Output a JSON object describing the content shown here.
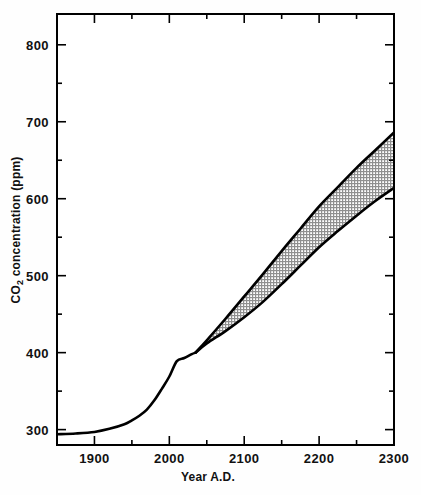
{
  "figure": {
    "background_color": "#fefefe",
    "frame_color": "#000000",
    "curve_color": "#000000",
    "band_fill_color": "#b4b4b4"
  },
  "chart_data": {
    "type": "area",
    "title": "",
    "subtitle": "",
    "xlabel": "Year A.D.",
    "ylabel": "CO2 concentration (ppm)",
    "ylabel_main": "CO",
    "ylabel_sub": "2",
    "ylabel_rest": " concentration (ppm)",
    "xlim": [
      1850,
      2300
    ],
    "ylim": [
      280,
      840
    ],
    "grid": false,
    "legend": "none",
    "x_major_ticks": [
      1900,
      2000,
      2100,
      2200,
      2300
    ],
    "x_major_tick_labels": [
      "1900",
      "2000",
      "2100",
      "2200",
      "2300"
    ],
    "x_minor_ticks": [
      1850,
      1950,
      2050,
      2150,
      2250
    ],
    "y_major_ticks": [
      300,
      400,
      500,
      600,
      700,
      800
    ],
    "y_major_tick_labels": [
      "300",
      "400",
      "500",
      "600",
      "700",
      "800"
    ],
    "y_minor_ticks": [
      350,
      450,
      550,
      650,
      750
    ],
    "annotations": [
      "Historical CO2 record rises slowly from ~295 ppm in 1850 to ~315 ppm by 1950",
      "Rapid acceleration after 1950; projections diverge into an upper and lower scenario band after about 2035",
      "Shaded band denotes the uncertainty range between high and low emission projections"
    ],
    "series": [
      {
        "name": "Historical and common trunk",
        "style": "solid-line",
        "x": [
          1850,
          1875,
          1900,
          1920,
          1940,
          1950,
          1960,
          1970,
          1980,
          1990,
          2000,
          2010,
          2020,
          2030,
          2035
        ],
        "values": [
          294,
          295,
          297,
          301,
          307,
          312,
          318,
          326,
          338,
          353,
          369,
          389,
          393,
          398,
          400
        ]
      },
      {
        "name": "Upper projection (high scenario)",
        "style": "solid-line",
        "x": [
          2035,
          2050,
          2075,
          2100,
          2125,
          2150,
          2175,
          2200,
          2225,
          2250,
          2275,
          2300
        ],
        "values": [
          400,
          416,
          444,
          473,
          502,
          532,
          561,
          590,
          615,
          640,
          663,
          686
        ]
      },
      {
        "name": "Lower projection (low scenario)",
        "style": "solid-line",
        "x": [
          2035,
          2050,
          2075,
          2100,
          2125,
          2150,
          2175,
          2200,
          2225,
          2250,
          2275,
          2300
        ],
        "values": [
          400,
          412,
          428,
          446,
          466,
          489,
          513,
          537,
          558,
          578,
          597,
          614
        ]
      }
    ],
    "band": {
      "name": "Projection uncertainty band",
      "fill": "hatched-gray",
      "upper_series": "Upper projection (high scenario)",
      "lower_series": "Lower projection (low scenario)",
      "start_year": 2035,
      "end_year": 2300,
      "end_upper_value": 686,
      "end_lower_value": 614
    }
  }
}
